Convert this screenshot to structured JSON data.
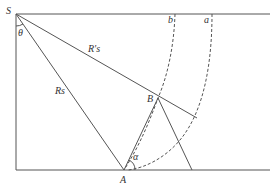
{
  "diagram": {
    "type": "geometry",
    "labels": {
      "S": "S",
      "theta": "θ",
      "Rs_prime": "R′s",
      "Rs": "Rs",
      "B": "B",
      "A": "A",
      "alpha": "α",
      "a": "a",
      "b": "b"
    },
    "colors": {
      "line": "#555555",
      "text": "#333333",
      "background": "#ffffff"
    }
  }
}
